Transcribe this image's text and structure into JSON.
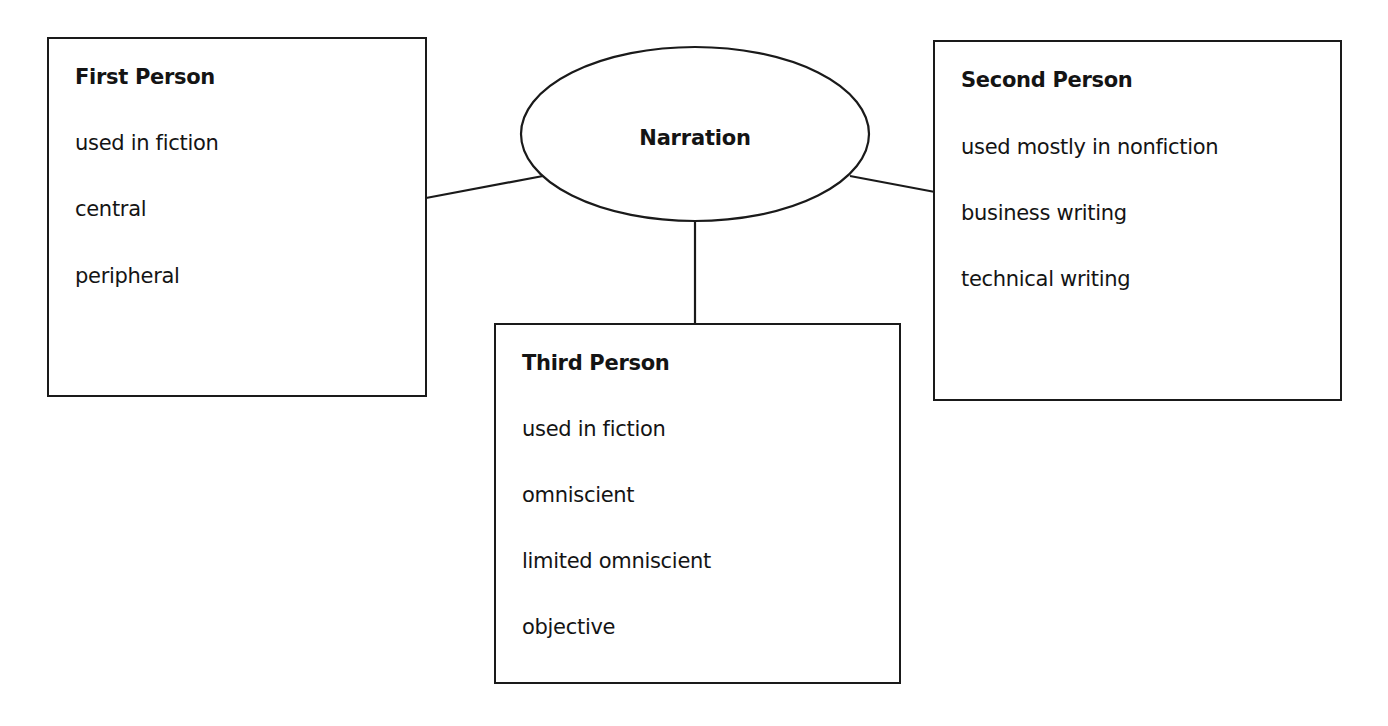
{
  "diagram": {
    "center": {
      "label": "Narration"
    },
    "nodes": [
      {
        "id": "first",
        "title": "First Person",
        "items": [
          "used in fiction",
          "central",
          "peripheral"
        ]
      },
      {
        "id": "second",
        "title": "Second Person",
        "items": [
          "used mostly in nonfiction",
          "business writing",
          "technical writing"
        ]
      },
      {
        "id": "third",
        "title": "Third Person",
        "items": [
          "used in fiction",
          "omniscient",
          "limited omniscient",
          "objective"
        ]
      }
    ],
    "edges": [
      {
        "from": "Narration",
        "to": "First Person"
      },
      {
        "from": "Narration",
        "to": "Second Person"
      },
      {
        "from": "Narration",
        "to": "Third Person"
      }
    ]
  }
}
